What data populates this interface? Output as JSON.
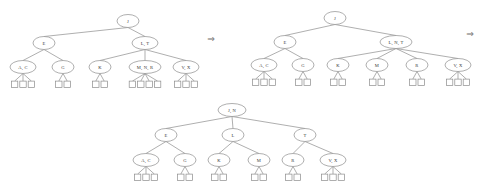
{
  "figure": {
    "line_color": "#8c8c8c",
    "node_fill": "#ffffff",
    "text_color": "#3a3a3a",
    "arrow_glyph": "⇒"
  },
  "arrows": [
    {
      "name": "arrow-stage1-to-stage2",
      "glyph": "⇒",
      "x": 211,
      "y": 39
    },
    {
      "name": "arrow-stage2-to-stage3",
      "glyph": "⇒",
      "x": 470,
      "y": 34
    }
  ],
  "trees": [
    {
      "id": "tree-before",
      "caption": "",
      "root": {
        "label": "J",
        "cx": 128,
        "cy": 21,
        "rx": 11,
        "ry": 6.5,
        "children": [
          {
            "label": "E",
            "cx": 44,
            "cy": 43,
            "rx": 11,
            "ry": 6.5,
            "children": [
              {
                "label": "A, C",
                "cx": 23,
                "cy": 67,
                "rx": 13,
                "ry": 6.5,
                "leaves": 3
              },
              {
                "label": "G",
                "cx": 63,
                "cy": 67,
                "rx": 11,
                "ry": 6.5,
                "leaves": 2
              }
            ]
          },
          {
            "label": "L, T",
            "cx": 145,
            "cy": 43,
            "rx": 13,
            "ry": 6.5,
            "children": [
              {
                "label": "K",
                "cx": 100,
                "cy": 67,
                "rx": 11,
                "ry": 6.5,
                "leaves": 2
              },
              {
                "label": "M, N, R",
                "cx": 145,
                "cy": 67,
                "rx": 16,
                "ry": 6.5,
                "leaves": 4
              },
              {
                "label": "V, X",
                "cx": 186,
                "cy": 67,
                "rx": 13,
                "ry": 6.5,
                "leaves": 3
              }
            ]
          }
        ]
      }
    },
    {
      "id": "tree-after-split",
      "caption": "",
      "root": {
        "label": "J",
        "cx": 335,
        "cy": 18,
        "rx": 11,
        "ry": 6.5,
        "children": [
          {
            "label": "E",
            "cx": 285,
            "cy": 42,
            "rx": 11,
            "ry": 6.5,
            "children": [
              {
                "label": "A, C",
                "cx": 264,
                "cy": 65,
                "rx": 13,
                "ry": 6.5,
                "leaves": 3
              },
              {
                "label": "G",
                "cx": 303,
                "cy": 65,
                "rx": 11,
                "ry": 6.5,
                "leaves": 2
              }
            ]
          },
          {
            "label": "L, N, T",
            "cx": 396,
            "cy": 42,
            "rx": 16,
            "ry": 6.5,
            "children": [
              {
                "label": "K",
                "cx": 338,
                "cy": 65,
                "rx": 11,
                "ry": 6.5,
                "leaves": 2
              },
              {
                "label": "M",
                "cx": 377,
                "cy": 65,
                "rx": 11,
                "ry": 6.5,
                "leaves": 2
              },
              {
                "label": "R",
                "cx": 417,
                "cy": 65,
                "rx": 11,
                "ry": 6.5,
                "leaves": 2
              },
              {
                "label": "V, X",
                "cx": 458,
                "cy": 65,
                "rx": 13,
                "ry": 6.5,
                "leaves": 3
              }
            ]
          }
        ]
      }
    },
    {
      "id": "tree-after-root-split",
      "caption": "",
      "root": {
        "label": "J, N",
        "cx": 232,
        "cy": 110,
        "rx": 14,
        "ry": 6.5,
        "children": [
          {
            "label": "E",
            "cx": 166,
            "cy": 135,
            "rx": 11,
            "ry": 6.5,
            "children": [
              {
                "label": "A, C",
                "cx": 146,
                "cy": 160,
                "rx": 13,
                "ry": 6.5,
                "leaves": 3
              },
              {
                "label": "G",
                "cx": 185,
                "cy": 160,
                "rx": 11,
                "ry": 6.5,
                "leaves": 2
              }
            ]
          },
          {
            "label": "L",
            "cx": 233,
            "cy": 135,
            "rx": 11,
            "ry": 6.5,
            "children": [
              {
                "label": "K",
                "cx": 219,
                "cy": 160,
                "rx": 11,
                "ry": 6.5,
                "leaves": 2
              },
              {
                "label": "M",
                "cx": 259,
                "cy": 160,
                "rx": 11,
                "ry": 6.5,
                "leaves": 2
              }
            ]
          },
          {
            "label": "T",
            "cx": 305,
            "cy": 135,
            "rx": 11,
            "ry": 6.5,
            "children": [
              {
                "label": "R",
                "cx": 293,
                "cy": 160,
                "rx": 11,
                "ry": 6.5,
                "leaves": 2
              },
              {
                "label": "V, X",
                "cx": 333,
                "cy": 160,
                "rx": 13,
                "ry": 6.5,
                "leaves": 3
              }
            ]
          }
        ]
      }
    }
  ]
}
